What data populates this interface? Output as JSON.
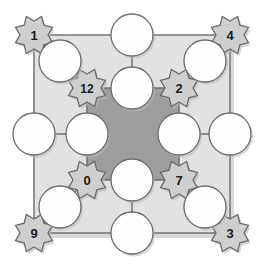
{
  "figure": {
    "type": "lattice-graph-diagram",
    "width": 266,
    "height": 269,
    "background": "#ffffff"
  },
  "colors": {
    "outer_square_fill": "#e2e2e2",
    "inner_square_fill": "#9d9d9d",
    "star_fill": "#cfcfcf",
    "circle_fill": "#fefefe",
    "stroke": "#6b6b6b",
    "text": "#1a1a1a",
    "shadow": "#b9b9b9"
  },
  "outer_square": {
    "name": "outer-square",
    "x": 34,
    "y": 35,
    "width": 196,
    "height": 198
  },
  "inner_square": {
    "name": "inner-square",
    "x": 87,
    "y": 88,
    "width": 92,
    "height": 92
  },
  "stars": [
    {
      "id": "star-1",
      "label": "1",
      "cx": 34,
      "cy": 35,
      "r": 20,
      "ring": "outer",
      "corner": "top-left"
    },
    {
      "id": "star-4",
      "label": "4",
      "cx": 230,
      "cy": 35,
      "r": 20,
      "ring": "outer",
      "corner": "top-right"
    },
    {
      "id": "star-9",
      "label": "9",
      "cx": 34,
      "cy": 233,
      "r": 20,
      "ring": "outer",
      "corner": "bottom-left"
    },
    {
      "id": "star-3",
      "label": "3",
      "cx": 230,
      "cy": 233,
      "r": 20,
      "ring": "outer",
      "corner": "bottom-right"
    },
    {
      "id": "star-12",
      "label": "12",
      "cx": 87,
      "cy": 88,
      "r": 20,
      "ring": "inner",
      "corner": "top-left"
    },
    {
      "id": "star-2",
      "label": "2",
      "cx": 179,
      "cy": 88,
      "r": 20,
      "ring": "inner",
      "corner": "top-right"
    },
    {
      "id": "star-0",
      "label": "0",
      "cx": 87,
      "cy": 180,
      "r": 20,
      "ring": "inner",
      "corner": "bottom-left"
    },
    {
      "id": "star-7",
      "label": "7",
      "cx": 179,
      "cy": 180,
      "r": 20,
      "ring": "inner",
      "corner": "bottom-right"
    }
  ],
  "circles": [
    {
      "id": "circle-outer-top",
      "cx": 132,
      "cy": 35,
      "r": 21
    },
    {
      "id": "circle-outer-bottom",
      "cx": 132,
      "cy": 233,
      "r": 21
    },
    {
      "id": "circle-outer-left",
      "cx": 34,
      "cy": 134,
      "r": 21
    },
    {
      "id": "circle-outer-right",
      "cx": 230,
      "cy": 134,
      "r": 21
    },
    {
      "id": "circle-diag-top-left",
      "cx": 60,
      "cy": 61,
      "r": 21
    },
    {
      "id": "circle-diag-top-right",
      "cx": 205,
      "cy": 61,
      "r": 21
    },
    {
      "id": "circle-diag-bottom-left",
      "cx": 60,
      "cy": 207,
      "r": 21
    },
    {
      "id": "circle-diag-bottom-right",
      "cx": 205,
      "cy": 207,
      "r": 21
    },
    {
      "id": "circle-inner-top",
      "cx": 132,
      "cy": 88,
      "r": 21
    },
    {
      "id": "circle-inner-bottom",
      "cx": 132,
      "cy": 180,
      "r": 21
    },
    {
      "id": "circle-inner-left",
      "cx": 87,
      "cy": 134,
      "r": 21
    },
    {
      "id": "circle-inner-right",
      "cx": 179,
      "cy": 134,
      "r": 21
    }
  ],
  "connectors": [
    {
      "id": "conn-tl-diag",
      "x1": 34,
      "y1": 35,
      "x2": 87,
      "y2": 88
    },
    {
      "id": "conn-tr-diag",
      "x1": 230,
      "y1": 35,
      "x2": 179,
      "y2": 88
    },
    {
      "id": "conn-bl-diag",
      "x1": 34,
      "y1": 233,
      "x2": 87,
      "y2": 180
    },
    {
      "id": "conn-br-diag",
      "x1": 230,
      "y1": 233,
      "x2": 179,
      "y2": 180
    },
    {
      "id": "conn-top-spoke",
      "x1": 132,
      "y1": 35,
      "x2": 132,
      "y2": 88
    },
    {
      "id": "conn-bottom-spoke",
      "x1": 132,
      "y1": 233,
      "x2": 132,
      "y2": 180
    },
    {
      "id": "conn-left-spoke",
      "x1": 34,
      "y1": 134,
      "x2": 87,
      "y2": 134
    },
    {
      "id": "conn-right-spoke",
      "x1": 230,
      "y1": 134,
      "x2": 179,
      "y2": 134
    }
  ]
}
